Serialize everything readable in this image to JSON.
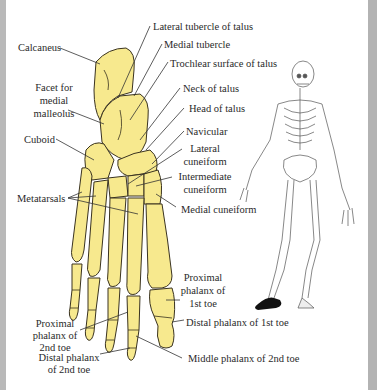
{
  "diagram": {
    "colors": {
      "bone_fill": "#f7e98e",
      "bone_outline": "#3a3320",
      "text": "#2a2a2a",
      "leader_line": "#333333",
      "frame_gray": "#b8b8b8",
      "shoe": "#111111"
    },
    "labels": {
      "lateral_tubercle": "Lateral tubercle of talus",
      "calcaneus": "Calcaneus",
      "medial_tubercle": "Medial tubercle",
      "trochlear_surface": "Trochlear surface  of talus",
      "facet_line1": "Facet for",
      "facet_line2": "medial",
      "facet_line3": "malleolus",
      "neck_of_talus": "Neck of talus",
      "head_of_talus": "Head  of talus",
      "cuboid": "Cuboid",
      "navicular": "Navicular",
      "lateral_cuneiform_line1": "Lateral",
      "lateral_cuneiform_line2": "cuneiform",
      "intermediate_cuneiform_line1": "Intermediate",
      "intermediate_cuneiform_line2": "cuneiform",
      "metatarsals": "Metatarsals",
      "medial_cuneiform": "Medial cuneiform",
      "proximal_1st_line1": "Proximal",
      "proximal_1st_line2": "phalanx of",
      "proximal_1st_line3": "1st toe",
      "distal_1st": "Distal phalanx of 1st toe",
      "proximal_2nd_line1": "Proximal",
      "proximal_2nd_line2": "phalanx of",
      "proximal_2nd_line3": "2nd toe",
      "distal_2nd_line1": "Distal phalanx",
      "distal_2nd_line2": "of 2nd toe",
      "middle_2nd": "Middle phalanx of 2nd toe"
    }
  }
}
